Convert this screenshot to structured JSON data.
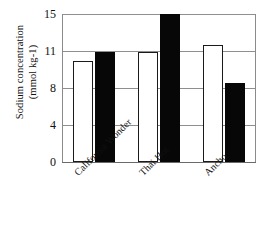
{
  "chart_data": {
    "type": "bar",
    "title": "",
    "subtitle": "",
    "xlabel": "",
    "ylabel": "Sodium concentration (mmol kg-1)",
    "ylabel_line1": "Sodium concentration",
    "ylabel_line2": "(mmol kg-1)",
    "categories": [
      "California Wonder",
      "Thai Hot",
      "Ancho"
    ],
    "yticks": [
      0,
      4,
      8,
      11,
      15
    ],
    "ytick_labels": [
      "0",
      "4",
      "8",
      "11",
      "15"
    ],
    "ylim": [
      0,
      15
    ],
    "grid": "horizontal",
    "legend": "none",
    "legend_position": "none",
    "series": [
      {
        "name": "white-series",
        "fill": "#ffffff",
        "edge": "#1a1a1a",
        "values": [
          10.2,
          10.9,
          11.6
        ]
      },
      {
        "name": "black-series",
        "fill": "#070707",
        "edge": "#070707",
        "values": [
          10.9,
          15.0,
          8.4
        ]
      }
    ],
    "colors": {
      "axis": "#6a6a6a",
      "gridline": "#8f8f8f",
      "text": "#111111",
      "white_bar_fill": "#ffffff",
      "white_bar_edge": "#1a1a1a",
      "black_bar_fill": "#070707",
      "background": "#ffffff"
    }
  }
}
